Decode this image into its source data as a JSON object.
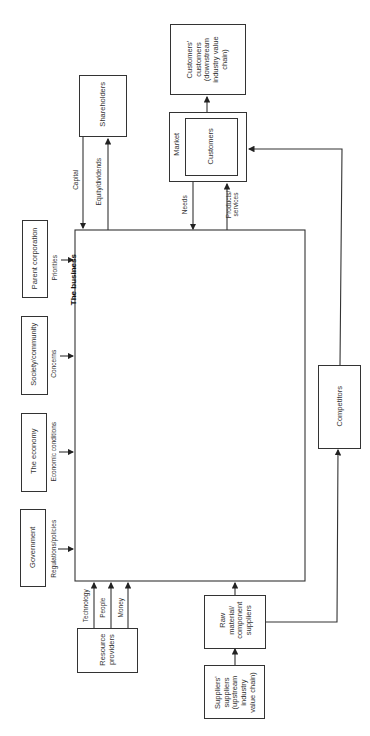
{
  "diagram": {
    "central": {
      "label": "The business"
    },
    "boxes": {
      "shareholders": "Shareholders",
      "customers_customers": "Customers'\ncustomers\n(downstream\nindustry value\nchain)",
      "market": "Market",
      "customers": "Customers",
      "parent_corporation": "Parent corporation",
      "society_community": "Society/community",
      "the_economy": "The economy",
      "government": "Government",
      "resource_providers": "Resource\nproviders",
      "raw_material_suppliers": "Raw\nmaterial/\ncomponent\nsuppliers",
      "suppliers_suppliers": "Suppliers'\nsuppliers\n(upstream\nindustry\nvalue chain)",
      "competitors": "Competitors"
    },
    "flows": {
      "capital": "Capital",
      "equity_dividends": "Equity/dividends",
      "needs": "Needs",
      "products_services": "Products/\nservices",
      "priorities": "Priorities",
      "concerns": "Concerns",
      "economic_conditions": "Economic conditions",
      "regulations_policies": "Regulations/policies",
      "technology": "Technology",
      "people": "People",
      "money": "Money"
    }
  }
}
